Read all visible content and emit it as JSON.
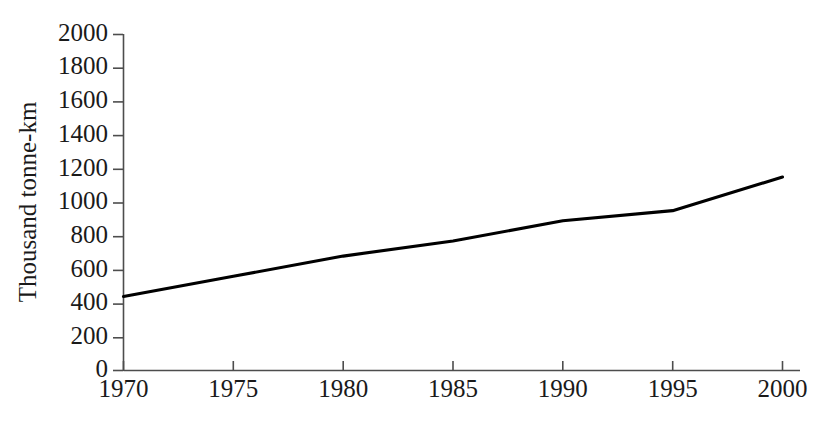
{
  "chart_data": {
    "type": "line",
    "title": "",
    "subtitle": "",
    "xlabel": "",
    "ylabel": "Thousand tonne-km",
    "x": [
      1970,
      1975,
      1980,
      1985,
      1990,
      1995,
      2000
    ],
    "categories": [
      "1970",
      "1975",
      "1980",
      "1985",
      "1990",
      "1995",
      "2000"
    ],
    "values": [
      440,
      560,
      680,
      770,
      890,
      950,
      1150
    ],
    "series": [
      {
        "name": "Freight transport",
        "values": [
          440,
          560,
          680,
          770,
          890,
          950,
          1150
        ],
        "color": "#000000"
      }
    ],
    "xlim": [
      1970,
      2000
    ],
    "ylim": [
      0,
      2000
    ],
    "xtick_labels": [
      "1970",
      "1975",
      "1980",
      "1985",
      "1990",
      "1995",
      "2000"
    ],
    "ytick_values": [
      0,
      200,
      400,
      600,
      800,
      1000,
      1200,
      1400,
      1600,
      1800,
      2000
    ],
    "ytick_labels": [
      "0",
      "200",
      "400",
      "600",
      "800",
      "1000",
      "1200",
      "1400",
      "1600",
      "1800",
      "2000"
    ],
    "grid": false,
    "legend": false,
    "legend_position": "none",
    "annotations": [],
    "axis_color": "#4d4d4d",
    "background_color": "#ffffff"
  }
}
